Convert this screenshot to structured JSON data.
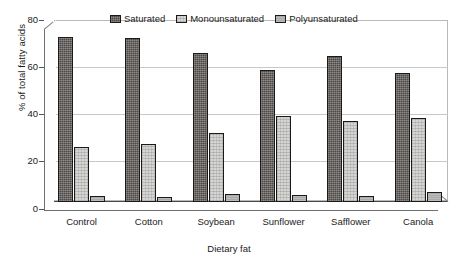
{
  "chart_data": {
    "type": "bar",
    "title": "",
    "subtitle": "",
    "xlabel": "Dietary fat",
    "ylabel": "% of total fatty acids",
    "categories": [
      "Control",
      "Cotton",
      "Soybean",
      "Sunflower",
      "Safflower",
      "Canola"
    ],
    "series": [
      {
        "name": "Saturated",
        "color": "#4a4744",
        "values": [
          73.0,
          72.5,
          66.0,
          58.5,
          64.5,
          57.0
        ]
      },
      {
        "name": "Monounsaturated",
        "color": "#d5d5d3",
        "values": [
          24.5,
          25.5,
          30.5,
          38.0,
          36.0,
          37.0
        ]
      },
      {
        "name": "Polyunsaturated",
        "color": "#a9a9a7",
        "values": [
          2.5,
          2.0,
          3.5,
          3.2,
          2.5,
          4.5
        ]
      }
    ],
    "ylim": [
      0,
      80
    ],
    "yticks": [
      0,
      20,
      40,
      60,
      80
    ],
    "ytick_labels": [
      "0",
      "20",
      "40",
      "60",
      "80"
    ],
    "grid": true,
    "grid_axis": "y",
    "legend_position": "top-center",
    "style": "3d-bar",
    "bar_border_color": "#1a1a1a"
  },
  "legend": {
    "items": [
      {
        "label": "Saturated",
        "swatch_name": "legend-swatch-saturated"
      },
      {
        "label": "Monounsaturated",
        "swatch_name": "legend-swatch-monounsaturated"
      },
      {
        "label": "Polyunsaturated",
        "swatch_name": "legend-swatch-polyunsaturated"
      }
    ]
  },
  "axes": {
    "y_title": "% of total fatty acids",
    "x_title": "Dietary fat",
    "y_tick_labels": [
      "80",
      "60",
      "40",
      "20",
      "0"
    ],
    "x_tick_labels": [
      "Control",
      "Cotton",
      "Soybean",
      "Sunflower",
      "Safflower",
      "Canola"
    ]
  }
}
